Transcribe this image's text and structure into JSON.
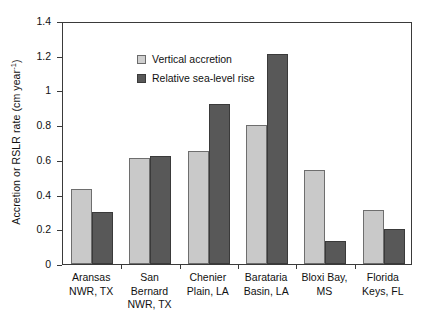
{
  "chart_data": {
    "type": "bar",
    "title": "",
    "xlabel": "",
    "ylabel": "Accretion or RSLR rate (cm year",
    "ylabel_sup": "-1",
    "ylabel_tail": ")",
    "ylim": [
      0,
      1.4
    ],
    "grid": false,
    "legend_position": "top-left inside plot",
    "y_ticks": [
      "0",
      "0.2",
      "0.4",
      "0.6",
      "0.8",
      "1",
      "1.2",
      "1.4"
    ],
    "y_tick_values": [
      0,
      0.2,
      0.4,
      0.6,
      0.8,
      1.0,
      1.2,
      1.4
    ],
    "categories": [
      "Aransas NWR, TX",
      "San Bernard NWR, TX",
      "Chenier Plain, LA",
      "Barataria Basin, LA",
      "Bloxi Bay, MS",
      "Florida Keys, FL"
    ],
    "category_lines": [
      [
        "Aransas",
        "NWR, TX"
      ],
      [
        "San Bernard",
        "NWR, TX"
      ],
      [
        "Chenier",
        "Plain, LA"
      ],
      [
        "Barataria",
        "Basin, LA"
      ],
      [
        "Bloxi Bay,",
        "MS"
      ],
      [
        "Florida",
        "Keys, FL"
      ]
    ],
    "series": [
      {
        "name": "Vertical accretion",
        "color": "#c9c9c9",
        "values": [
          0.43,
          0.61,
          0.65,
          0.8,
          0.54,
          0.31
        ]
      },
      {
        "name": "Relative sea-level rise",
        "color": "#585858",
        "values": [
          0.3,
          0.62,
          0.92,
          1.21,
          0.13,
          0.2
        ]
      }
    ]
  },
  "legend": {
    "items": [
      {
        "label": "Vertical accretion"
      },
      {
        "label": "Relative sea-level rise"
      }
    ]
  }
}
